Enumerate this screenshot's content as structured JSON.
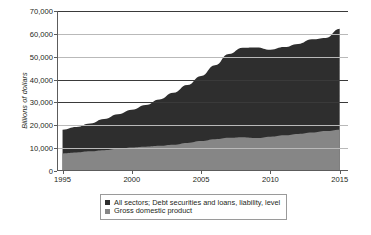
{
  "chart_data": {
    "type": "area",
    "title": "",
    "xlabel": "",
    "ylabel": "Billions of dollars",
    "xlim": [
      1994.6,
      2015.6
    ],
    "ylim": [
      0,
      70000
    ],
    "grid": true,
    "legend_position": "bottom",
    "y_ticks": [
      "0",
      "10,000",
      "20,000",
      "30,000",
      "40,000",
      "50,000",
      "60,000",
      "70,000"
    ],
    "y_tick_values": [
      0,
      10000,
      20000,
      30000,
      40000,
      50000,
      60000,
      70000
    ],
    "x_ticks": [
      "1995",
      "2000",
      "2005",
      "2010",
      "2015"
    ],
    "x_tick_values": [
      1995,
      2000,
      2005,
      2010,
      2015
    ],
    "x": [
      1995,
      1996,
      1997,
      1998,
      1999,
      2000,
      2001,
      2002,
      2003,
      2004,
      2005,
      2006,
      2007,
      2008,
      2009,
      2010,
      2011,
      2012,
      2013,
      2014,
      2015
    ],
    "series": [
      {
        "name": "All sectors; Debt securities and loans, liability, level",
        "color": "#2e2e2e",
        "values": [
          18100,
          19300,
          20800,
          22700,
          24800,
          26800,
          28900,
          31300,
          34200,
          37600,
          41600,
          46300,
          51200,
          53900,
          54000,
          53000,
          54200,
          55600,
          57600,
          58200,
          62200
        ]
      },
      {
        "name": "Gross domestic product",
        "color": "#868686",
        "values": [
          7700,
          8100,
          8600,
          9100,
          9700,
          10300,
          10600,
          11000,
          11500,
          12300,
          13100,
          13900,
          14500,
          14800,
          14400,
          15000,
          15600,
          16200,
          16800,
          17500,
          18100
        ]
      }
    ]
  },
  "legend": {
    "items": [
      {
        "label": "All sectors; Debt securities and loans, liability, level",
        "color": "#2e2e2e"
      },
      {
        "label": "Gross domestic product",
        "color": "#868686"
      }
    ]
  }
}
